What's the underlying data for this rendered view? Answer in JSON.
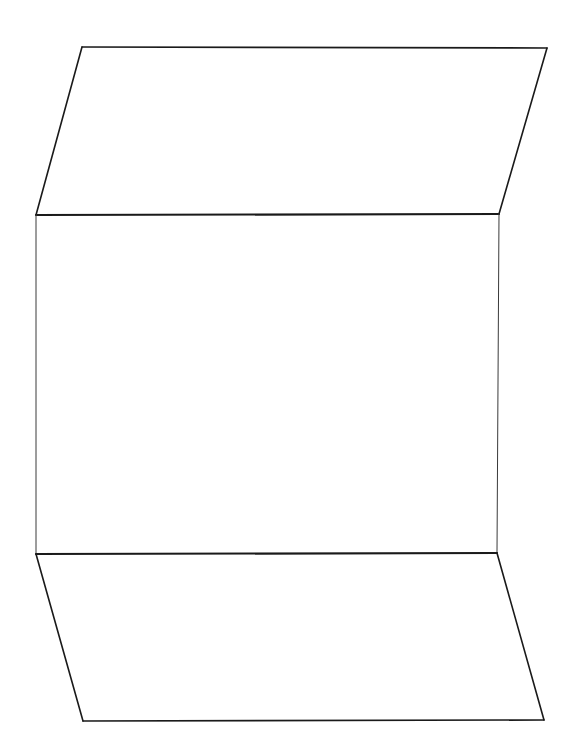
{
  "canvas": {
    "width": 574,
    "height": 753,
    "background": "#ffffff"
  },
  "style": {
    "stroke": "#1a1a1a",
    "thin_stroke": "#3a3a3a"
  },
  "shape": {
    "description": "Folded strip: top parallelogram flap, central rectangle, bottom parallelogram flap",
    "vertices": {
      "top_left": [
        82,
        47
      ],
      "top_right": [
        547,
        48
      ],
      "upper_fold_left": [
        36,
        215
      ],
      "upper_fold_right": [
        499,
        214
      ],
      "lower_fold_left": [
        36,
        554
      ],
      "lower_fold_right": [
        497,
        553
      ],
      "bottom_left": [
        83,
        721
      ],
      "bottom_right": [
        544,
        720
      ]
    },
    "panels": [
      {
        "name": "top-flap",
        "points": "82,47 547,48 499,214 36,215"
      },
      {
        "name": "center-rectangle",
        "points": "36,215 499,214 497,553 36,554"
      },
      {
        "name": "bottom-flap",
        "points": "36,554 497,553 544,720 83,721"
      }
    ]
  }
}
